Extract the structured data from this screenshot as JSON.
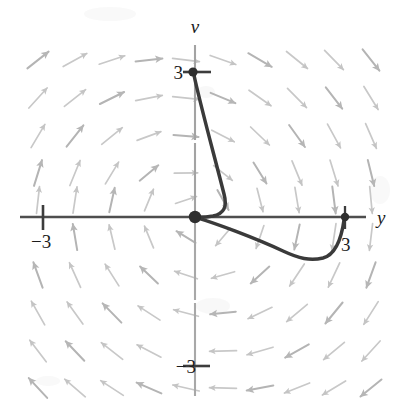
{
  "figure": {
    "kind": "phase-plane-direction-field",
    "background_color": "#ffffff",
    "axes": {
      "horizontal": {
        "name": "y",
        "label": "y",
        "label_style": "italic-serif",
        "color": "#4a4a4a",
        "pixel_y": 217,
        "pixel_x_start": 20,
        "pixel_x_end": 366,
        "label_pixel_x": 381,
        "label_pixel_y": 217
      },
      "vertical": {
        "name": "v",
        "label": "v",
        "label_style": "italic-serif",
        "color": "#9a9a9a",
        "pixel_x": 195,
        "pixel_y_start": 45,
        "pixel_y_end": 396,
        "label_pixel_x": 195,
        "label_pixel_y": 30
      }
    },
    "ticks": [
      {
        "id": "tick-y-neg3",
        "axis": "horizontal",
        "value": -3,
        "label": "−3",
        "pixel_x": 43,
        "pixel_y": 217,
        "label_pixel_x": 43,
        "label_pixel_y": 241
      },
      {
        "id": "tick-y-pos3",
        "axis": "horizontal",
        "value": 3,
        "label": "3",
        "pixel_x": 345,
        "pixel_y": 217,
        "label_pixel_x": 347,
        "label_pixel_y": 244
      },
      {
        "id": "tick-v-pos3",
        "axis": "vertical",
        "value": 3,
        "label": "3",
        "pixel_x": 195,
        "pixel_y": 72,
        "label_pixel_x": 182,
        "label_pixel_y": 78
      },
      {
        "id": "tick-v-neg3",
        "axis": "vertical",
        "value": -3,
        "label": "−3",
        "pixel_x": 195,
        "pixel_y": 366,
        "label_pixel_x": 178,
        "label_pixel_y": 372
      }
    ],
    "scale": {
      "pixels_per_unit_x": 50.7,
      "pixels_per_unit_y": 49.0
    },
    "trajectory": {
      "name": "solution-curve",
      "color": "#3a3a3a",
      "stroke_width": 3.4,
      "start_point": {
        "y": 0,
        "v": 3,
        "pixel_x": 193,
        "pixel_y": 72
      },
      "through_origin": {
        "y": 0,
        "v": 0,
        "pixel_x": 195,
        "pixel_y": 217
      },
      "end_point": {
        "y": 3,
        "v": 0,
        "pixel_x": 345,
        "pixel_y": 217
      },
      "minimum_point": {
        "y": 2.25,
        "v": -0.83,
        "pixel_x": 309,
        "pixel_y": 258
      },
      "max_bulge_point": {
        "y": 0.59,
        "v": 0.14,
        "pixel_x": 225,
        "pixel_y": 210
      }
    },
    "markers": [
      {
        "id": "marker-start",
        "label": "start-point",
        "pixel_x": 193,
        "pixel_y": 72,
        "radius": 4.6,
        "color": "#2e2e2e"
      },
      {
        "id": "marker-origin",
        "label": "origin-point",
        "pixel_x": 195,
        "pixel_y": 217,
        "radius": 6.2,
        "color": "#2e2e2e"
      },
      {
        "id": "marker-end",
        "label": "end-point",
        "pixel_x": 345,
        "pixel_y": 217,
        "radius": 4.2,
        "color": "#2e2e2e"
      }
    ],
    "direction_field": {
      "arrow_color": "#c8c8c8",
      "arrow_color_dark": "#b4b4b4",
      "arrow_length": 26,
      "columns_x": [
        38,
        75,
        112,
        149,
        186,
        223,
        260,
        297,
        334,
        371
      ],
      "rows_y": [
        60,
        98,
        136,
        173,
        200,
        237,
        275,
        313,
        351,
        388
      ],
      "note": "arrows rotate from down-right in upper-left, to straight-down on the right above axis, to straight-up below axis on the left, to up-left in lower-right"
    }
  }
}
